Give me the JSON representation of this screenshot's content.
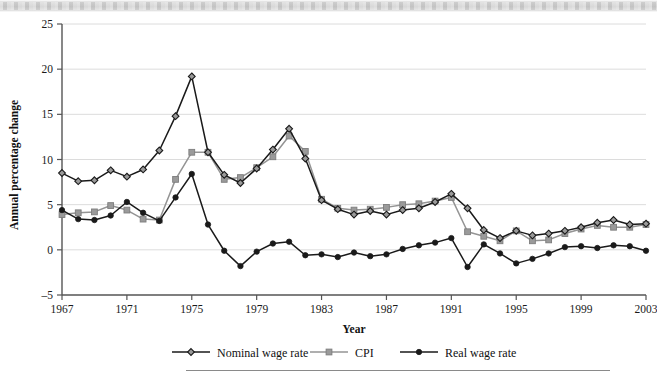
{
  "figure": {
    "y_axis_title": "Annual percentage change",
    "x_axis_title": "Year"
  },
  "legend": {
    "position": "bottom",
    "entries": [
      {
        "label": "Nominal wage rate",
        "marker": "diamond-open-icon",
        "color": "#1a1a1a"
      },
      {
        "label": "CPI",
        "marker": "square-filled-icon",
        "color": "#949494"
      },
      {
        "label": "Real wage rate",
        "marker": "circle-filled-icon",
        "color": "#1a1a1a"
      }
    ]
  },
  "chart_data": {
    "type": "line",
    "title": "",
    "xlabel": "Year",
    "ylabel": "Annual percentage change",
    "xlim": [
      1967,
      2003
    ],
    "ylim": [
      -5,
      25
    ],
    "y_ticks": [
      -5,
      0,
      5,
      10,
      15,
      20,
      25
    ],
    "x_ticks": [
      1967,
      1971,
      1975,
      1979,
      1983,
      1987,
      1991,
      1995,
      1999,
      2003
    ],
    "grid": "horizontal",
    "x": [
      1967,
      1968,
      1969,
      1970,
      1971,
      1972,
      1973,
      1974,
      1975,
      1976,
      1977,
      1978,
      1979,
      1980,
      1981,
      1982,
      1983,
      1984,
      1985,
      1986,
      1987,
      1988,
      1989,
      1990,
      1991,
      1992,
      1993,
      1994,
      1995,
      1996,
      1997,
      1998,
      1999,
      2000,
      2001,
      2002,
      2003
    ],
    "series": [
      {
        "name": "Nominal wage rate",
        "color": "#1a1a1a",
        "marker": "diamond-open-icon",
        "values": [
          8.5,
          7.6,
          7.7,
          8.8,
          8.1,
          8.9,
          11.0,
          14.8,
          19.2,
          10.8,
          8.3,
          7.4,
          9.0,
          11.1,
          13.4,
          10.1,
          5.5,
          4.5,
          3.9,
          4.3,
          3.9,
          4.4,
          4.6,
          5.3,
          6.2,
          4.6,
          2.2,
          1.3,
          2.1,
          1.6,
          1.8,
          2.1,
          2.5,
          3.0,
          3.3,
          2.8,
          2.9
        ]
      },
      {
        "name": "CPI",
        "color": "#949494",
        "marker": "square-filled-icon",
        "values": [
          3.9,
          4.1,
          4.2,
          4.9,
          4.4,
          3.4,
          3.3,
          7.8,
          10.8,
          10.8,
          7.8,
          8.0,
          9.1,
          10.3,
          12.6,
          10.9,
          5.6,
          4.6,
          4.4,
          4.5,
          4.7,
          5.0,
          5.1,
          5.4,
          5.8,
          2.0,
          1.5,
          1.0,
          2.1,
          1.0,
          1.1,
          1.8,
          2.3,
          2.7,
          2.5,
          2.5,
          2.8
        ]
      },
      {
        "name": "Real wage rate",
        "color": "#1a1a1a",
        "marker": "circle-filled-icon",
        "values": [
          4.4,
          3.4,
          3.3,
          3.8,
          5.3,
          4.1,
          3.2,
          5.8,
          8.4,
          2.8,
          -0.1,
          -1.8,
          -0.2,
          0.7,
          0.9,
          -0.6,
          -0.5,
          -0.8,
          -0.3,
          -0.7,
          -0.5,
          0.1,
          0.5,
          0.8,
          1.3,
          -1.9,
          0.6,
          -0.4,
          -1.5,
          -1.0,
          -0.4,
          0.3,
          0.4,
          0.2,
          0.5,
          0.4,
          -0.1
        ]
      }
    ]
  }
}
